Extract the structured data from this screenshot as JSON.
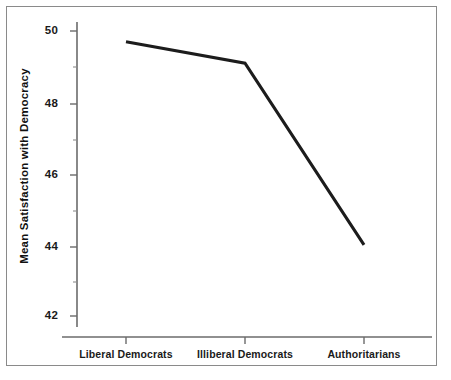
{
  "chart_data": {
    "type": "line",
    "title": "",
    "xlabel": "",
    "ylabel": "Mean Satisfaction with Democracy",
    "categories": [
      "Liberal Democrats",
      "Illiberal Democrats",
      "Authoritarians"
    ],
    "values": [
      49.7,
      49.1,
      44.0
    ],
    "series": [
      {
        "name": "Mean Satisfaction with Democracy",
        "values": [
          49.7,
          49.1,
          44.0
        ]
      }
    ],
    "ylim": [
      41.5,
      50.5
    ],
    "y_major_ticks": [
      42,
      44,
      46,
      48,
      50
    ],
    "y_tick_labels": [
      "42",
      "44",
      "46",
      "48",
      "50"
    ],
    "y_minor_ticks": [
      43,
      45,
      47,
      49
    ],
    "grid": false,
    "legend": "none",
    "line_color": "#1c1c1c",
    "axis_color": "#6b6b6b",
    "background": "#ffffff"
  },
  "figure": {
    "frame_border_color": "#8a8a8a",
    "y_axis_title": "Mean Satisfaction with Democracy"
  }
}
